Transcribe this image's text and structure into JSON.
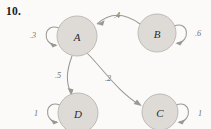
{
  "problem": {
    "number": "10."
  },
  "diagram": {
    "type": "state-transition-diagram",
    "background_color": "#fbfaf8",
    "node_fill_color": "#dedbd7",
    "node_stroke_color": "#b9b5b0",
    "edge_color": "#9b9894",
    "label_color": "#6f6f6f",
    "nodes": [
      {
        "id": "A",
        "label": "A",
        "cx": 77,
        "cy": 36,
        "r": 20
      },
      {
        "id": "B",
        "label": "B",
        "cx": 157,
        "cy": 33,
        "r": 19
      },
      {
        "id": "C",
        "label": "C",
        "cx": 160,
        "cy": 112,
        "r": 18
      },
      {
        "id": "D",
        "label": "D",
        "cx": 78,
        "cy": 113,
        "r": 20
      }
    ],
    "edges": [
      {
        "from": "B",
        "to": "A",
        "label": ".4",
        "label_x": 117,
        "label_y": 15
      },
      {
        "from": "A",
        "to": "D",
        "label": ".5",
        "label_x": 58,
        "label_y": 75
      },
      {
        "from": "A",
        "to": "C",
        "label": ".2",
        "label_x": 108,
        "label_y": 78
      }
    ],
    "self_loops": [
      {
        "node": "A",
        "label": ".3",
        "label_x": 33,
        "label_y": 35,
        "side": "left"
      },
      {
        "node": "B",
        "label": ".6",
        "label_x": 198,
        "label_y": 33,
        "side": "right"
      },
      {
        "node": "C",
        "label": "1",
        "label_x": 200,
        "label_y": 113,
        "side": "right"
      },
      {
        "node": "D",
        "label": "1",
        "label_x": 36,
        "label_y": 113,
        "side": "left"
      }
    ]
  }
}
